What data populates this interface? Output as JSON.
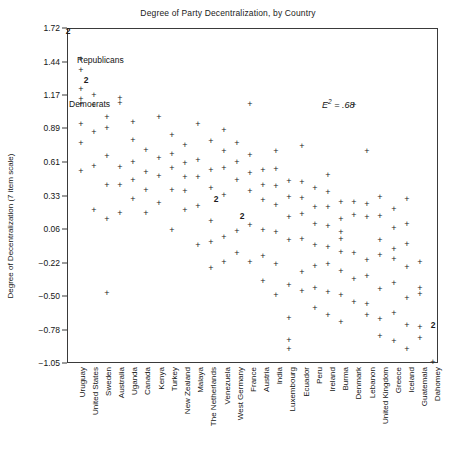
{
  "chart_data": {
    "type": "scatter",
    "title": "Degree of Party Decentralization, by Country",
    "xlabel": "",
    "ylabel": "Degree of Decentralization (7 item scale)",
    "ylim": [
      -1.05,
      1.72
    ],
    "yticks": [
      1.72,
      1.44,
      1.17,
      0.89,
      0.61,
      0.33,
      0.06,
      -0.22,
      -0.5,
      -0.78,
      -1.05
    ],
    "ytick_labels": [
      "1.72",
      "1.44",
      "1.17",
      "0.89",
      "0.61",
      "0.33",
      "0.06",
      "-0.22",
      "-0.50",
      "-0.78",
      "-1.05"
    ],
    "grid": false,
    "legend": "none",
    "marker": "+",
    "annotations": [
      {
        "text": "E2 = .68",
        "display": "E² = .68",
        "x": 25.0,
        "y": 1.17,
        "style": "italic"
      },
      {
        "text": "Republicans",
        "x": 1.0,
        "y": 1.58,
        "style": "point-label"
      },
      {
        "text": "Democrats",
        "x": 0.6,
        "y": 1.17,
        "style": "point-label"
      }
    ],
    "note": "Marker '2' indicates two coincident observations at that point.",
    "categories": [
      "Uruguay",
      "United States",
      "Sweden",
      "Australia",
      "Uganda",
      "Canada",
      "Kenya",
      "Turkey",
      "New Zealand",
      "Malaya",
      "The Netherlands",
      "Venezuela",
      "West Germany",
      "France",
      "Austria",
      "India",
      "Luxembourg",
      "Ecuador",
      "Peru",
      "Ireland",
      "Burma",
      "Denmark",
      "Lebanon",
      "United Kingdom",
      "Greece",
      "Iceland",
      "Guatemala",
      "Dahomey"
    ],
    "points": [
      {
        "country": "Uruguay",
        "ci": 0,
        "values": [
          1.72,
          1.72,
          0.06
        ],
        "counts": [
          2,
          1
        ]
      },
      {
        "country": "United States",
        "ci": 1,
        "values": [
          1.47,
          1.38,
          1.25,
          1.25,
          1.17,
          0.86,
          0.83,
          0.58
        ],
        "counts": [
          1,
          1,
          2,
          1,
          1,
          1
        ]
      },
      {
        "country": "Sweden",
        "ci": 2,
        "values": [
          1.08,
          0.86,
          0.53,
          0.33,
          0.06
        ]
      },
      {
        "country": "Australia",
        "ci": 3,
        "values": [
          0.94,
          0.86,
          0.58,
          0.33,
          0.11,
          -0.22
        ]
      },
      {
        "country": "Uganda",
        "ci": 4,
        "values": [
          1.22,
          1.14,
          0.5,
          0.33,
          -0.47
        ]
      },
      {
        "country": "Canada",
        "ci": 5,
        "values": [
          0.89,
          0.72,
          0.61,
          0.5,
          0.36,
          0.28
        ]
      },
      {
        "country": "Kenya",
        "ci": 6,
        "values": [
          0.72,
          0.61,
          0.47,
          0.28
        ]
      },
      {
        "country": "Turkey",
        "ci": 7,
        "values": [
          0.83,
          0.61,
          0.47,
          0.31
        ]
      },
      {
        "country": "New Zealand",
        "ci": 8,
        "values": [
          0.97,
          0.78,
          0.64,
          0.44,
          0.25,
          0.08
        ]
      },
      {
        "country": "Malaya",
        "ci": 9,
        "values": [
          0.72,
          0.58,
          0.44,
          0.33,
          0.17
        ]
      },
      {
        "country": "The Netherlands",
        "ci": 10,
        "values": [
          0.86,
          0.61,
          0.5,
          0.42,
          0.25,
          0.06,
          -0.17
        ]
      },
      {
        "country": "Venezuela",
        "ci": 11,
        "values": [
          0.72,
          0.61,
          0.44,
          0.39,
          0.25,
          0.06,
          -0.11
        ]
      },
      {
        "country": "West Germany",
        "ci": 12,
        "values": [
          0.64,
          0.58,
          0.44,
          0.39,
          0.25,
          0.11,
          -0.11,
          -0.39
        ]
      },
      {
        "country": "France",
        "ci": 13,
        "values": [
          0.69,
          0.53,
          0.42,
          0.31,
          0.14,
          0.0,
          -0.22,
          -0.61
        ]
      },
      {
        "country": "Austria",
        "ci": 14,
        "values": [
          0.58,
          0.47,
          0.36,
          0.25,
          0.11,
          0.0,
          -0.19
        ]
      },
      {
        "country": "India",
        "ci": 15,
        "values": [
          0.61,
          0.53,
          0.39,
          0.31,
          0.17,
          0.08,
          -0.22,
          -0.33
        ]
      },
      {
        "country": "Luxembourg",
        "ci": 16,
        "values": [
          1.17,
          0.64,
          0.33,
          0.25,
          0.25,
          0.06,
          -0.08,
          -0.33
        ],
        "counts": [
          1,
          1,
          1,
          2,
          1,
          1,
          1
        ]
      },
      {
        "country": "Ecuador",
        "ci": 17,
        "values": [
          0.42,
          0.31,
          0.17,
          -0.06,
          -0.42,
          -0.69,
          -0.83,
          -0.92
        ]
      },
      {
        "country": "Peru",
        "ci": 18,
        "values": [
          0.47,
          0.33,
          0.19,
          0.06,
          -0.14,
          -0.42,
          -0.58
        ]
      },
      {
        "country": "Ireland",
        "ci": 19,
        "values": [
          0.36,
          0.25,
          0.11,
          0.0,
          -0.17,
          -0.42,
          -0.61
        ]
      },
      {
        "country": "Burma",
        "ci": 20,
        "values": [
          0.47,
          0.33,
          0.22,
          0.06,
          -0.11,
          -0.25,
          -0.5,
          -0.69
        ]
      },
      {
        "country": "Denmark",
        "ci": 21,
        "values": [
          0.25,
          0.11,
          0.0,
          -0.06,
          -0.17,
          -0.33,
          -0.53,
          -0.75
        ]
      },
      {
        "country": "Lebanon",
        "ci": 22,
        "values": [
          0.97,
          0.25,
          0.14,
          -0.17,
          -0.39,
          -0.58
        ]
      },
      {
        "country": "United Kingdom",
        "ci": 23,
        "values": [
          0.72,
          0.28,
          0.17,
          -0.19,
          -0.33,
          -0.58,
          -0.67
        ]
      },
      {
        "country": "Greece",
        "ci": 24,
        "values": [
          0.31,
          0.14,
          -0.06,
          -0.19,
          -0.47,
          -0.72,
          -0.86
        ]
      },
      {
        "country": "Iceland",
        "ci": 25,
        "values": [
          0.22,
          0.06,
          -0.11,
          -0.22,
          -0.42,
          -0.67,
          -0.89
        ]
      },
      {
        "country": "Guatemala",
        "ci": 26,
        "values": [
          0.33,
          0.11,
          -0.06,
          -0.25,
          -0.5,
          -0.72,
          -0.94
        ]
      },
      {
        "country": "Dahomey",
        "ci": 27,
        "values": [
          -0.17,
          -0.39,
          -0.44,
          -0.72,
          -0.83,
          -1.05
        ],
        "counts": [
          1,
          1,
          1,
          1,
          2,
          1
        ]
      }
    ],
    "raw_marks": [
      {
        "x": 68,
        "y": 31,
        "m": "2"
      },
      {
        "x": 81,
        "y": 59,
        "m": "+"
      },
      {
        "x": 81,
        "y": 70,
        "m": "+"
      },
      {
        "x": 86,
        "y": 80,
        "m": "2"
      },
      {
        "x": 81,
        "y": 89,
        "m": "+"
      },
      {
        "x": 81,
        "y": 99,
        "m": "+"
      },
      {
        "x": 81,
        "y": 104,
        "m": "+"
      },
      {
        "x": 81,
        "y": 124,
        "m": "+"
      },
      {
        "x": 81,
        "y": 143,
        "m": "+"
      },
      {
        "x": 81,
        "y": 171,
        "m": "+"
      },
      {
        "x": 94,
        "y": 95,
        "m": "+"
      },
      {
        "x": 94,
        "y": 105,
        "m": "+"
      },
      {
        "x": 94,
        "y": 132,
        "m": "+"
      },
      {
        "x": 94,
        "y": 166,
        "m": "+"
      },
      {
        "x": 94,
        "y": 210,
        "m": "+"
      },
      {
        "x": 107,
        "y": 117,
        "m": "+"
      },
      {
        "x": 107,
        "y": 128,
        "m": "+"
      },
      {
        "x": 107,
        "y": 156,
        "m": "+"
      },
      {
        "x": 107,
        "y": 185,
        "m": "+"
      },
      {
        "x": 107,
        "y": 219,
        "m": "+"
      },
      {
        "x": 107,
        "y": 293,
        "m": "+"
      },
      {
        "x": 120,
        "y": 98,
        "m": "+"
      },
      {
        "x": 120,
        "y": 103,
        "m": "+"
      },
      {
        "x": 120,
        "y": 167,
        "m": "+"
      },
      {
        "x": 120,
        "y": 185,
        "m": "+"
      },
      {
        "x": 120,
        "y": 213,
        "m": "+"
      },
      {
        "x": 133,
        "y": 122,
        "m": "+"
      },
      {
        "x": 133,
        "y": 140,
        "m": "+"
      },
      {
        "x": 133,
        "y": 162,
        "m": "+"
      },
      {
        "x": 133,
        "y": 180,
        "m": "+"
      },
      {
        "x": 133,
        "y": 199,
        "m": "+"
      },
      {
        "x": 146,
        "y": 150,
        "m": "+"
      },
      {
        "x": 146,
        "y": 172,
        "m": "+"
      },
      {
        "x": 146,
        "y": 190,
        "m": "+"
      },
      {
        "x": 146,
        "y": 213,
        "m": "+"
      },
      {
        "x": 159,
        "y": 117,
        "m": "+"
      },
      {
        "x": 159,
        "y": 158,
        "m": "+"
      },
      {
        "x": 159,
        "y": 176,
        "m": "+"
      },
      {
        "x": 159,
        "y": 203,
        "m": "+"
      },
      {
        "x": 172,
        "y": 135,
        "m": "+"
      },
      {
        "x": 172,
        "y": 154,
        "m": "+"
      },
      {
        "x": 172,
        "y": 168,
        "m": "+"
      },
      {
        "x": 172,
        "y": 190,
        "m": "+"
      },
      {
        "x": 172,
        "y": 230,
        "m": "+"
      },
      {
        "x": 185,
        "y": 145,
        "m": "+"
      },
      {
        "x": 185,
        "y": 163,
        "m": "+"
      },
      {
        "x": 185,
        "y": 177,
        "m": "+"
      },
      {
        "x": 185,
        "y": 191,
        "m": "+"
      },
      {
        "x": 185,
        "y": 210,
        "m": "+"
      },
      {
        "x": 198,
        "y": 124,
        "m": "+"
      },
      {
        "x": 198,
        "y": 160,
        "m": "+"
      },
      {
        "x": 198,
        "y": 177,
        "m": "+"
      },
      {
        "x": 198,
        "y": 206,
        "m": "+"
      },
      {
        "x": 198,
        "y": 245,
        "m": "+"
      },
      {
        "x": 211,
        "y": 141,
        "m": "+"
      },
      {
        "x": 211,
        "y": 170,
        "m": "+"
      },
      {
        "x": 211,
        "y": 188,
        "m": "+"
      },
      {
        "x": 216,
        "y": 199,
        "m": "2"
      },
      {
        "x": 211,
        "y": 221,
        "m": "+"
      },
      {
        "x": 211,
        "y": 242,
        "m": "+"
      },
      {
        "x": 211,
        "y": 268,
        "m": "+"
      },
      {
        "x": 224,
        "y": 130,
        "m": "+"
      },
      {
        "x": 224,
        "y": 151,
        "m": "+"
      },
      {
        "x": 224,
        "y": 168,
        "m": "+"
      },
      {
        "x": 224,
        "y": 195,
        "m": "+"
      },
      {
        "x": 224,
        "y": 237,
        "m": "+"
      },
      {
        "x": 224,
        "y": 262,
        "m": "+"
      },
      {
        "x": 237,
        "y": 143,
        "m": "+"
      },
      {
        "x": 237,
        "y": 162,
        "m": "+"
      },
      {
        "x": 237,
        "y": 180,
        "m": "+"
      },
      {
        "x": 242,
        "y": 216,
        "m": "2"
      },
      {
        "x": 237,
        "y": 231,
        "m": "+"
      },
      {
        "x": 237,
        "y": 253,
        "m": "+"
      },
      {
        "x": 250,
        "y": 104,
        "m": "+"
      },
      {
        "x": 250,
        "y": 155,
        "m": "+"
      },
      {
        "x": 250,
        "y": 173,
        "m": "+"
      },
      {
        "x": 250,
        "y": 191,
        "m": "+"
      },
      {
        "x": 250,
        "y": 225,
        "m": "+"
      },
      {
        "x": 250,
        "y": 262,
        "m": "+"
      },
      {
        "x": 263,
        "y": 170,
        "m": "+"
      },
      {
        "x": 263,
        "y": 185,
        "m": "+"
      },
      {
        "x": 263,
        "y": 200,
        "m": "+"
      },
      {
        "x": 263,
        "y": 230,
        "m": "+"
      },
      {
        "x": 263,
        "y": 256,
        "m": "+"
      },
      {
        "x": 263,
        "y": 281,
        "m": "+"
      },
      {
        "x": 276,
        "y": 151,
        "m": "+"
      },
      {
        "x": 276,
        "y": 169,
        "m": "+"
      },
      {
        "x": 276,
        "y": 186,
        "m": "+"
      },
      {
        "x": 276,
        "y": 205,
        "m": "+"
      },
      {
        "x": 276,
        "y": 232,
        "m": "+"
      },
      {
        "x": 276,
        "y": 264,
        "m": "+"
      },
      {
        "x": 276,
        "y": 295,
        "m": "+"
      },
      {
        "x": 289,
        "y": 181,
        "m": "+"
      },
      {
        "x": 289,
        "y": 197,
        "m": "+"
      },
      {
        "x": 289,
        "y": 217,
        "m": "+"
      },
      {
        "x": 289,
        "y": 240,
        "m": "+"
      },
      {
        "x": 289,
        "y": 285,
        "m": "+"
      },
      {
        "x": 289,
        "y": 318,
        "m": "+"
      },
      {
        "x": 289,
        "y": 340,
        "m": "+"
      },
      {
        "x": 289,
        "y": 349,
        "m": "+"
      },
      {
        "x": 302,
        "y": 146,
        "m": "+"
      },
      {
        "x": 302,
        "y": 182,
        "m": "+"
      },
      {
        "x": 302,
        "y": 198,
        "m": "+"
      },
      {
        "x": 302,
        "y": 214,
        "m": "+"
      },
      {
        "x": 302,
        "y": 239,
        "m": "+"
      },
      {
        "x": 302,
        "y": 272,
        "m": "+"
      },
      {
        "x": 302,
        "y": 291,
        "m": "+"
      },
      {
        "x": 315,
        "y": 188,
        "m": "+"
      },
      {
        "x": 315,
        "y": 207,
        "m": "+"
      },
      {
        "x": 315,
        "y": 224,
        "m": "+"
      },
      {
        "x": 315,
        "y": 245,
        "m": "+"
      },
      {
        "x": 315,
        "y": 266,
        "m": "+"
      },
      {
        "x": 315,
        "y": 288,
        "m": "+"
      },
      {
        "x": 315,
        "y": 308,
        "m": "+"
      },
      {
        "x": 328,
        "y": 175,
        "m": "+"
      },
      {
        "x": 328,
        "y": 192,
        "m": "+"
      },
      {
        "x": 328,
        "y": 207,
        "m": "+"
      },
      {
        "x": 328,
        "y": 226,
        "m": "+"
      },
      {
        "x": 328,
        "y": 247,
        "m": "+"
      },
      {
        "x": 328,
        "y": 264,
        "m": "+"
      },
      {
        "x": 328,
        "y": 292,
        "m": "+"
      },
      {
        "x": 328,
        "y": 315,
        "m": "+"
      },
      {
        "x": 341,
        "y": 202,
        "m": "+"
      },
      {
        "x": 341,
        "y": 219,
        "m": "+"
      },
      {
        "x": 341,
        "y": 232,
        "m": "+"
      },
      {
        "x": 341,
        "y": 239,
        "m": "+"
      },
      {
        "x": 341,
        "y": 252,
        "m": "+"
      },
      {
        "x": 341,
        "y": 271,
        "m": "+"
      },
      {
        "x": 341,
        "y": 295,
        "m": "+"
      },
      {
        "x": 341,
        "y": 322,
        "m": "+"
      },
      {
        "x": 354,
        "y": 105,
        "m": "+"
      },
      {
        "x": 354,
        "y": 202,
        "m": "+"
      },
      {
        "x": 354,
        "y": 215,
        "m": "+"
      },
      {
        "x": 354,
        "y": 253,
        "m": "+"
      },
      {
        "x": 354,
        "y": 279,
        "m": "+"
      },
      {
        "x": 354,
        "y": 302,
        "m": "+"
      },
      {
        "x": 367,
        "y": 151,
        "m": "+"
      },
      {
        "x": 367,
        "y": 204,
        "m": "+"
      },
      {
        "x": 367,
        "y": 217,
        "m": "+"
      },
      {
        "x": 367,
        "y": 260,
        "m": "+"
      },
      {
        "x": 367,
        "y": 276,
        "m": "+"
      },
      {
        "x": 367,
        "y": 304,
        "m": "+"
      },
      {
        "x": 367,
        "y": 315,
        "m": "+"
      },
      {
        "x": 380,
        "y": 197,
        "m": "+"
      },
      {
        "x": 380,
        "y": 216,
        "m": "+"
      },
      {
        "x": 380,
        "y": 240,
        "m": "+"
      },
      {
        "x": 380,
        "y": 255,
        "m": "+"
      },
      {
        "x": 380,
        "y": 289,
        "m": "+"
      },
      {
        "x": 380,
        "y": 319,
        "m": "+"
      },
      {
        "x": 380,
        "y": 336,
        "m": "+"
      },
      {
        "x": 394,
        "y": 209,
        "m": "+"
      },
      {
        "x": 394,
        "y": 228,
        "m": "+"
      },
      {
        "x": 394,
        "y": 249,
        "m": "+"
      },
      {
        "x": 394,
        "y": 259,
        "m": "+"
      },
      {
        "x": 394,
        "y": 283,
        "m": "+"
      },
      {
        "x": 394,
        "y": 313,
        "m": "+"
      },
      {
        "x": 394,
        "y": 341,
        "m": "+"
      },
      {
        "x": 407,
        "y": 199,
        "m": "+"
      },
      {
        "x": 407,
        "y": 224,
        "m": "+"
      },
      {
        "x": 407,
        "y": 244,
        "m": "+"
      },
      {
        "x": 407,
        "y": 267,
        "m": "+"
      },
      {
        "x": 407,
        "y": 298,
        "m": "+"
      },
      {
        "x": 407,
        "y": 325,
        "m": "+"
      },
      {
        "x": 407,
        "y": 349,
        "m": "+"
      },
      {
        "x": 420,
        "y": 262,
        "m": "+"
      },
      {
        "x": 420,
        "y": 288,
        "m": "+"
      },
      {
        "x": 420,
        "y": 294,
        "m": "+"
      },
      {
        "x": 420,
        "y": 327,
        "m": "+"
      },
      {
        "x": 420,
        "y": 338,
        "m": "+"
      },
      {
        "x": 433,
        "y": 325,
        "m": "2"
      },
      {
        "x": 433,
        "y": 362,
        "m": "+"
      }
    ]
  },
  "figure": {
    "annotation_display": "E",
    "annotation_sup": "2",
    "annotation_tail": " = .68",
    "republicans_label": "Republicans",
    "democrats_label": "Democrats"
  }
}
